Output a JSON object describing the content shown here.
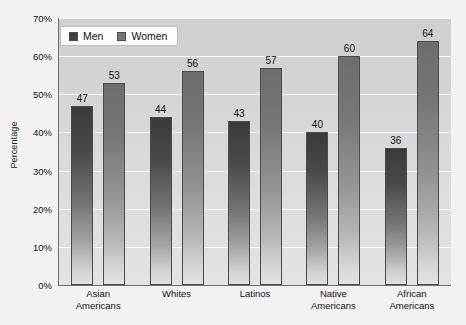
{
  "chart_data": {
    "type": "bar",
    "title": "",
    "subtitle": "",
    "xlabel": "",
    "ylabel": "Percentage",
    "ylim": [
      0,
      70
    ],
    "grid": true,
    "legend_position": "top-left-inside",
    "categories": [
      "Asian Americans",
      "Whites",
      "Latinos",
      "Native Americans",
      "African Americans"
    ],
    "category_lines": [
      [
        "Asian",
        "Americans"
      ],
      [
        "Whites",
        ""
      ],
      [
        "Latinos",
        ""
      ],
      [
        "Native",
        "Americans"
      ],
      [
        "African",
        "Americans"
      ]
    ],
    "series": [
      {
        "name": "Men",
        "color": "#3f3f3f",
        "values": [
          47,
          44,
          43,
          40,
          36
        ]
      },
      {
        "name": "Women",
        "color": "#767676",
        "values": [
          53,
          56,
          57,
          60,
          64
        ]
      }
    ],
    "y_ticks": [
      {
        "value": 70,
        "label": "70%"
      },
      {
        "value": 60,
        "label": "60%"
      },
      {
        "value": 50,
        "label": "50%"
      },
      {
        "value": 40,
        "label": "40%"
      },
      {
        "value": 30,
        "label": "30%"
      },
      {
        "value": 20,
        "label": "20%"
      },
      {
        "value": 10,
        "label": "10%"
      },
      {
        "value": 0,
        "label": "0%"
      }
    ]
  },
  "legend": {
    "items": [
      {
        "label": "Men"
      },
      {
        "label": "Women"
      }
    ]
  },
  "axes": {
    "y_title": "Percentage"
  },
  "colors": {
    "figure_background": "#f2f2f2",
    "plot_background": "#d8d8d8",
    "gridline": "#fbfbfb",
    "axis_line": "#6e6e6e",
    "men_bar": "#3f3f3f",
    "women_bar": "#767676",
    "text": "#111111"
  }
}
